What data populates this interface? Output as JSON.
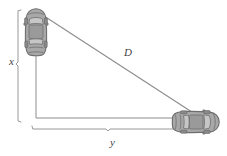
{
  "figure": {
    "background_color": "#ffffff",
    "line_color": "#8c8c8c",
    "label_color": "#3f3f3f",
    "car_body_color": "#a8a8a8",
    "car_outline_color": "#6e6e6e",
    "car_glass_color": "#c2c2c2"
  },
  "labels": {
    "vertical": "x",
    "horizontal": "y",
    "diagonal": "D"
  },
  "objects": {
    "car_top": {
      "name": "car-top-left",
      "orientation": "vertical",
      "x": 24,
      "y": 8,
      "width": 24,
      "height": 48
    },
    "car_right": {
      "name": "car-bottom-right",
      "orientation": "horizontal",
      "x": 172,
      "y": 110,
      "width": 48,
      "height": 24
    }
  },
  "geometry": {
    "corner_x": 36,
    "corner_y": 118,
    "vertical_leg_top_y": 10,
    "horizontal_leg_right_x": 200,
    "hypotenuse_start": [
      44,
      16
    ],
    "hypotenuse_end": [
      198,
      116
    ],
    "x_bracket_left": 18,
    "x_bracket_top": 10,
    "x_bracket_bottom": 122,
    "y_bracket_bottom": 133,
    "y_bracket_left": 32,
    "y_bracket_right": 213
  }
}
